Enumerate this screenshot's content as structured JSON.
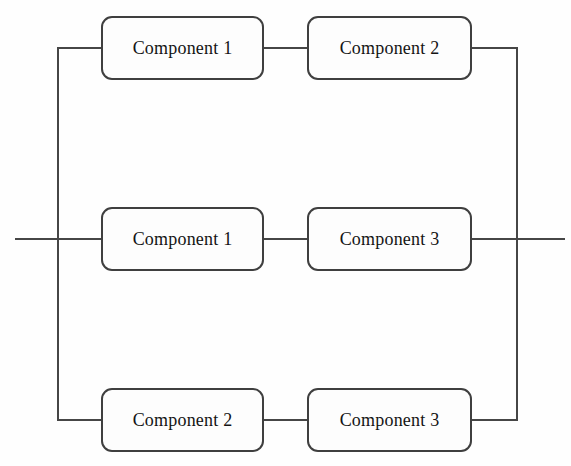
{
  "diagram": {
    "type": "reliability-block-diagram",
    "colors": {
      "background": "#fefefe",
      "line": "#464646",
      "box_border": "#3f3f3f",
      "box_fill": "#fdfdfd",
      "text": "#141414"
    },
    "branches": [
      {
        "first": "Component 1",
        "second": "Component 2"
      },
      {
        "first": "Component 1",
        "second": "Component 3"
      },
      {
        "first": "Component 2",
        "second": "Component 3"
      }
    ]
  }
}
